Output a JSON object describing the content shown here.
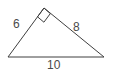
{
  "figure": {
    "name": "right-triangle",
    "background_color": "#ffffff",
    "stroke_color": "#3f3f3f",
    "label_color": "#4a4a4a",
    "stroke_width": 1,
    "right_angle_marker": {
      "name": "right-angle-square",
      "at_vertex": "apex",
      "size": 9
    },
    "vertices": {
      "left": {
        "x": 8,
        "y": 57
      },
      "apex": {
        "x": 44,
        "y": 8
      },
      "right": {
        "x": 104,
        "y": 57
      }
    },
    "sides": [
      {
        "name": "leg-a",
        "label": "6",
        "from": "left",
        "to": "apex"
      },
      {
        "name": "leg-b",
        "label": "8",
        "from": "apex",
        "to": "right"
      },
      {
        "name": "hypotenuse",
        "label": "10",
        "from": "left",
        "to": "right"
      }
    ],
    "labels": {
      "leg_a": "6",
      "leg_b": "8",
      "hypotenuse": "10"
    }
  }
}
